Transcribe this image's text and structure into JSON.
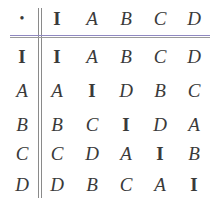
{
  "table": {
    "operator": "•",
    "header": [
      "I",
      "A",
      "B",
      "C",
      "D"
    ],
    "rows": [
      {
        "label": "I",
        "cells": [
          "I",
          "A",
          "B",
          "C",
          "D"
        ]
      },
      {
        "label": "A",
        "cells": [
          "A",
          "I",
          "D",
          "B",
          "C"
        ]
      },
      {
        "label": "B",
        "cells": [
          "B",
          "C",
          "I",
          "D",
          "A"
        ]
      },
      {
        "label": "C",
        "cells": [
          "C",
          "D",
          "A",
          "I",
          "B"
        ]
      },
      {
        "label": "D",
        "cells": [
          "D",
          "B",
          "C",
          "A",
          "I"
        ]
      }
    ]
  }
}
